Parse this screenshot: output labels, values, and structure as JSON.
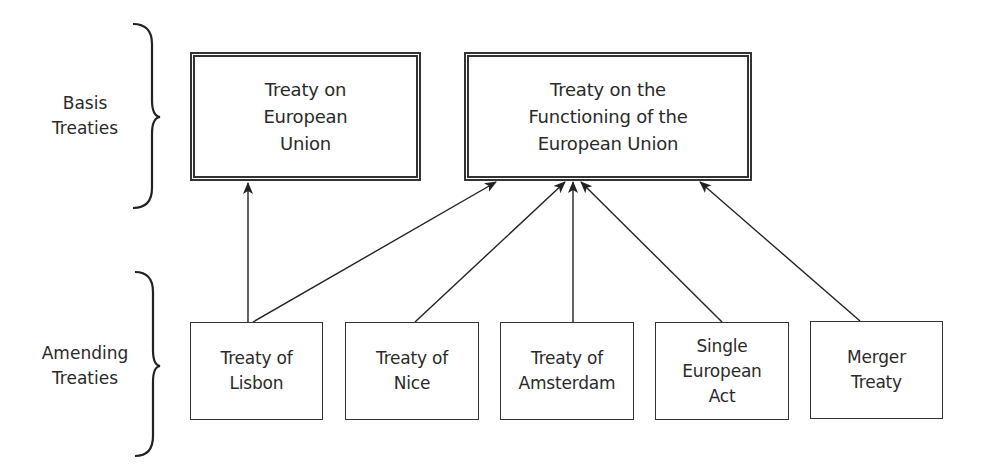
{
  "groups": {
    "basis": {
      "label": "Basis\nTreaties"
    },
    "amending": {
      "label": "Amending\nTreaties"
    }
  },
  "basis_treaties": [
    {
      "id": "teu",
      "label": "Treaty on\nEuropean\nUnion"
    },
    {
      "id": "tfeu",
      "label": "Treaty on the\nFunctioning of the\nEuropean Union"
    }
  ],
  "amending_treaties": [
    {
      "id": "lisbon",
      "label": "Treaty of\nLisbon"
    },
    {
      "id": "nice",
      "label": "Treaty of\nNice"
    },
    {
      "id": "amsterdam",
      "label": "Treaty of\nAmsterdam"
    },
    {
      "id": "sea",
      "label": "Single\nEuropean\nAct"
    },
    {
      "id": "merger",
      "label": "Merger\nTreaty"
    }
  ],
  "edges": [
    {
      "from": "lisbon",
      "to": "teu"
    },
    {
      "from": "lisbon",
      "to": "tfeu"
    },
    {
      "from": "nice",
      "to": "tfeu"
    },
    {
      "from": "amsterdam",
      "to": "tfeu"
    },
    {
      "from": "sea",
      "to": "tfeu"
    },
    {
      "from": "merger",
      "to": "tfeu"
    }
  ],
  "colors": {
    "stroke": "#333333",
    "text": "#2a2a2a",
    "background": "#ffffff"
  }
}
